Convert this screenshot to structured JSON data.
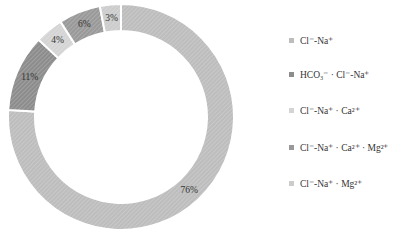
{
  "chart_data": {
    "type": "pie",
    "donut": true,
    "title": "",
    "categories": [
      "Cl⁻-Na⁺",
      "HCO₃⁻ · Cl⁻-Na⁺",
      "Cl⁻-Na⁺ · Ca²⁺",
      "Cl⁻-Na⁺ · Ca²⁺ · Mg²⁺",
      "Cl⁻-Na⁺ · Mg²⁺"
    ],
    "values": [
      76,
      11,
      4,
      6,
      3
    ],
    "data_labels": [
      "76%",
      "11%",
      "4%",
      "6%",
      "3%"
    ],
    "colors": [
      "#bdbdbd",
      "#8c8c8c",
      "#d4d4d4",
      "#999999",
      "#cccccc"
    ],
    "start_angle": "12 o'clock",
    "direction": "clockwise",
    "legend_position": "right"
  }
}
